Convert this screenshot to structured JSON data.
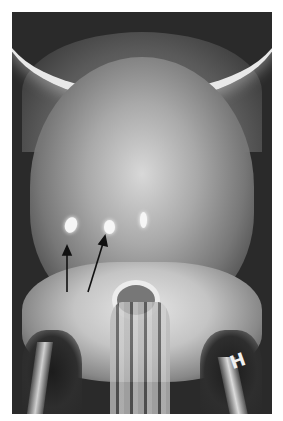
{
  "image": {
    "type": "skull radiograph",
    "view": "frontal",
    "side_marker": "H",
    "annotations": [
      {
        "type": "arrow",
        "direction": "up",
        "points_to": "calcification left"
      },
      {
        "type": "arrow",
        "direction": "up-right",
        "points_to": "calcification center-left"
      }
    ],
    "colors": {
      "frame_border": "#ffffff",
      "film_dark": "#2a2a2a",
      "bone_bright": "#e6e6e6"
    }
  }
}
